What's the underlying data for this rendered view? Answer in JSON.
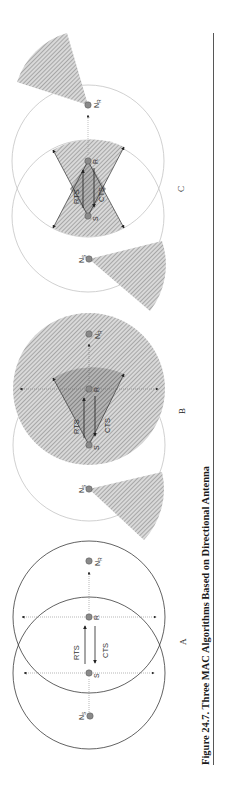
{
  "figure": {
    "caption": "Figure 24.7.  Three MAC Algorithms Based on Directional Antenna",
    "orientation": "rotated 90 degrees counter-clockwise",
    "colors": {
      "node_fill": "#8a8a8a",
      "hatch_light": "#bdbdbd",
      "hatch_dark": "#7a7a7a",
      "circle_dark": "#333333",
      "circle_light": "#bbbbbb",
      "rule": "#444444"
    },
    "panels": [
      {
        "id": "A",
        "label": "A",
        "nodes": {
          "ns": "N",
          "ns_sub": "S",
          "s": "S",
          "r": "R",
          "nr": "N",
          "nr_sub": "R"
        },
        "messages": {
          "rts": "RTS",
          "cts": "CTS"
        }
      },
      {
        "id": "B",
        "label": "B",
        "nodes": {
          "ns": "N",
          "ns_sub": "S",
          "s": "S",
          "r": "R",
          "nr": "N",
          "nr_sub": "R"
        },
        "messages": {
          "rts": "RTS",
          "cts": "CTS"
        }
      },
      {
        "id": "C",
        "label": "C",
        "nodes": {
          "ns": "N",
          "ns_sub": "S",
          "s": "S",
          "r": "R",
          "nr": "N",
          "nr_sub": "R"
        },
        "messages": {
          "rts": "RTS",
          "cts": "CTS"
        }
      }
    ]
  }
}
